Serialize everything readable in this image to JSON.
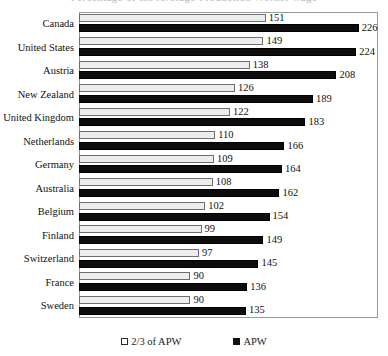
{
  "title_remnant": "Percentage of the Average Production Worker wage",
  "legend": {
    "position": "bottom-center",
    "entries": [
      {
        "label": "2/3 of APW",
        "swatch": "light",
        "color": "#ffffff"
      },
      {
        "label": "APW",
        "swatch": "dark",
        "color": "#111111"
      }
    ]
  },
  "chart_data": {
    "type": "bar",
    "orientation": "horizontal",
    "title": "",
    "xlabel": "",
    "ylabel": "",
    "grid": false,
    "xlim": [
      0,
      240
    ],
    "categories": [
      "Canada",
      "United States",
      "Austria",
      "New Zealand",
      "United Kingdom",
      "Netherlands",
      "Germany",
      "Australia",
      "Belgium",
      "Finland",
      "Switzerland",
      "France",
      "Sweden"
    ],
    "series": [
      {
        "name": "2/3 of APW",
        "color": "#ededed",
        "values": [
          151,
          149,
          138,
          126,
          122,
          110,
          109,
          108,
          102,
          99,
          97,
          90,
          90
        ]
      },
      {
        "name": "APW",
        "color": "#0d0d0d",
        "values": [
          226,
          224,
          208,
          189,
          183,
          166,
          164,
          162,
          154,
          149,
          145,
          136,
          135
        ]
      }
    ]
  }
}
